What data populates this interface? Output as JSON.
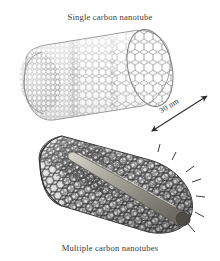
{
  "figure": {
    "background_color": "#ffffff",
    "width": 220,
    "height": 261,
    "top_caption": "Single carbon nanotube",
    "bottom_caption": "Multiple carbon nanotubes",
    "scale_label": "30 nm",
    "colors": {
      "single_wall_mesh": "#8a8a8a",
      "multi_wall_mesh": "#4a4a4a",
      "inner_core": "#9a9a94",
      "text": "#3b3b3b",
      "arrow": "#2e2e2e"
    }
  }
}
